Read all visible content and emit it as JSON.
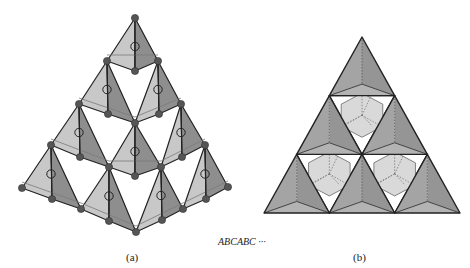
{
  "figure": {
    "panel_a": {
      "label": "(a)",
      "description": "Stacked tetrahedral pyramid with vertex atoms and interstitial circles"
    },
    "panel_b": {
      "label": "(b)",
      "description": "Top view of tetrahedra arranged in triangular layer"
    },
    "stacking_sequence": "ABCABC ···"
  },
  "colors": {
    "light_face": "#c8c8c8",
    "dark_face": "#8e8e8e",
    "mid_face": "#a9a9a9",
    "atom": "#555555",
    "edge": "#222222",
    "pale_face": "#d9d9d9"
  }
}
